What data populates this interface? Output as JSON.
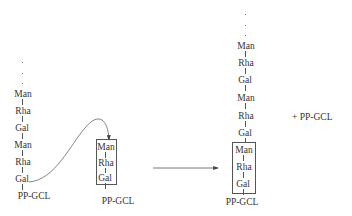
{
  "diagram": {
    "left_chain": {
      "units": [
        "Man",
        "Rha",
        "Gal",
        "Man",
        "Rha",
        "Gal"
      ],
      "anchor": "PP-GCL"
    },
    "middle_chain": {
      "units": [
        "Man",
        "Rha",
        "Gal"
      ],
      "anchor": "PP-GCL"
    },
    "product_chain": {
      "units": [
        "Man",
        "Rha",
        "Gal",
        "Man",
        "Rha",
        "Gal",
        "Man",
        "Rha",
        "Gal"
      ],
      "anchor": "PP-GCL"
    },
    "byproduct": "+ PP-GCL",
    "colors": {
      "line": "#555555",
      "text": "#333333"
    }
  }
}
